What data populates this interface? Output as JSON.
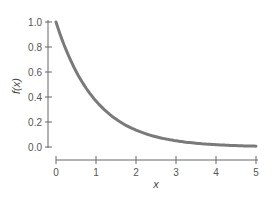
{
  "chart_data": {
    "type": "line",
    "title": "",
    "xlabel": "x",
    "ylabel": "f(x)",
    "xlim": [
      0,
      5
    ],
    "ylim": [
      0,
      1.0
    ],
    "x_ticks": [
      "0",
      "1",
      "2",
      "3",
      "4",
      "5"
    ],
    "y_ticks": [
      "0.0",
      "0.2",
      "0.4",
      "0.6",
      "0.8",
      "1.0"
    ],
    "grid": false,
    "legend": null,
    "series": [
      {
        "name": "f(x) = e^(-x)",
        "color": "#7a7a7a",
        "x": [
          0,
          0.25,
          0.5,
          0.75,
          1,
          1.25,
          1.5,
          1.75,
          2,
          2.5,
          3,
          3.5,
          4,
          4.5,
          5
        ],
        "values": [
          1.0,
          0.78,
          0.61,
          0.47,
          0.37,
          0.29,
          0.22,
          0.17,
          0.14,
          0.08,
          0.05,
          0.03,
          0.02,
          0.01,
          0.01
        ]
      }
    ]
  }
}
